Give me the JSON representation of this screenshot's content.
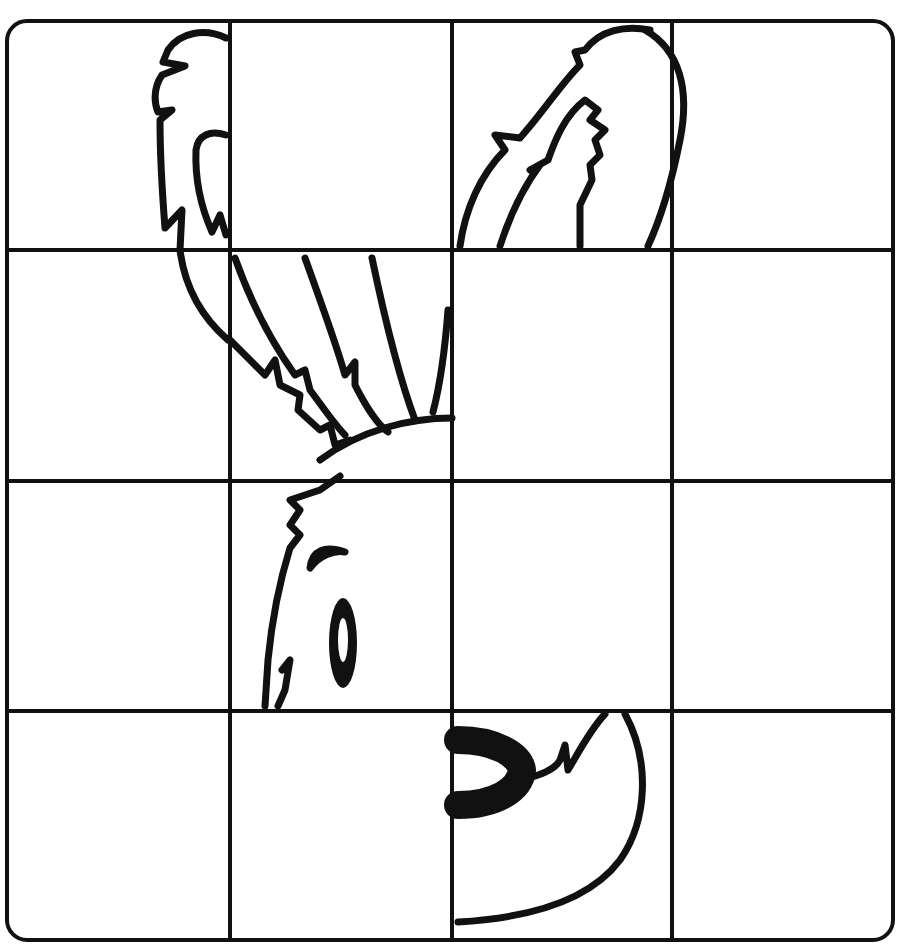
{
  "worksheet": {
    "type": "grid-drawing-symmetry",
    "subject": "rabbit-head-half",
    "grid": {
      "rows": 4,
      "cols": 4
    },
    "colors": {
      "line": "#111111",
      "background": "#ffffff"
    }
  }
}
